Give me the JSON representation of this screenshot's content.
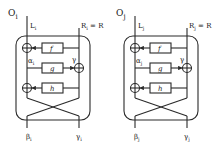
{
  "diagrams": [
    {
      "title": "O",
      "title_sub": "i",
      "top_left_label": "L",
      "top_left_sub": "i",
      "top_right_label": "R",
      "top_right_sub": "i",
      "top_right_suffix": " = R",
      "alpha_label": "α",
      "alpha_sub": "i",
      "gamma_label": "γ",
      "functions": [
        "f",
        "g",
        "h"
      ],
      "bottom_left_label": "β",
      "bottom_left_sub": "i",
      "bottom_right_label": "γ",
      "bottom_right_sub": "i"
    },
    {
      "title": "O",
      "title_sub": "j",
      "top_left_label": "L",
      "top_left_sub": "j",
      "top_right_label": "R",
      "top_right_sub": "j",
      "top_right_suffix": " = R",
      "alpha_label": "α",
      "alpha_sub": "j",
      "gamma_label": "γ",
      "functions": [
        "f",
        "g",
        "h"
      ],
      "bottom_left_label": "β",
      "bottom_left_sub": "j",
      "bottom_right_label": "γ",
      "bottom_right_sub": "j"
    }
  ],
  "colors": {
    "stroke": "#2a2a2a",
    "background": "#ffffff"
  }
}
